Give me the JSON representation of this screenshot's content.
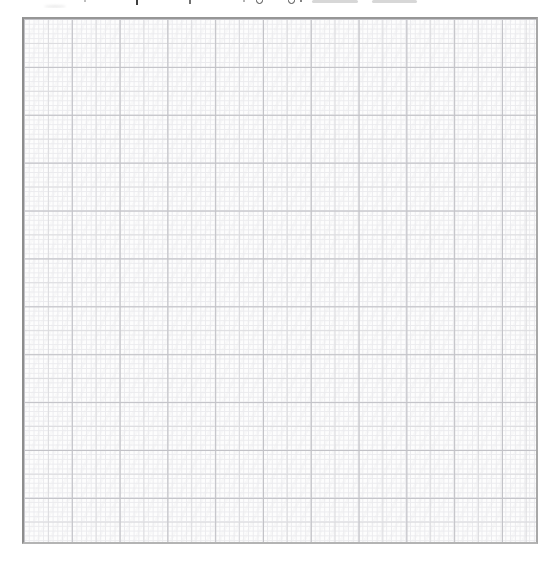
{
  "page": {
    "background_color": "#ffffff"
  },
  "clipped_caption": {
    "note": "Only descender fragments of a cropped, unreadable text line are visible at the top edge",
    "fragments": [
      {
        "kind": "smudge",
        "x": 44,
        "y": 5,
        "w": 22,
        "h": 3,
        "color": "#ececec"
      },
      {
        "kind": "dot",
        "x": 84,
        "y": 0,
        "w": 2,
        "h": 2,
        "color": "#a8a8a8"
      },
      {
        "kind": "stem",
        "x": 136,
        "y": 0,
        "w": 2,
        "h": 5,
        "color": "#3f3f3f"
      },
      {
        "kind": "stem",
        "x": 189,
        "y": 0,
        "w": 2,
        "h": 4,
        "color": "#707070"
      },
      {
        "kind": "dot",
        "x": 243,
        "y": 0,
        "w": 2,
        "h": 2,
        "color": "#9a9a9a"
      },
      {
        "kind": "loop",
        "x": 256,
        "y": -3,
        "w": 7,
        "h": 7,
        "color": "#4a4a4a"
      },
      {
        "kind": "loop",
        "x": 288,
        "y": -3,
        "w": 7,
        "h": 7,
        "color": "#4a4a4a"
      },
      {
        "kind": "dot",
        "x": 300,
        "y": 0,
        "w": 2,
        "h": 2,
        "color": "#5a5a5a"
      },
      {
        "kind": "bar",
        "x": 312,
        "y": 0,
        "w": 46,
        "h": 2.5,
        "color": "#d7d7d7"
      },
      {
        "kind": "bar",
        "x": 372,
        "y": 0,
        "w": 45,
        "h": 2.5,
        "color": "#d7d7d7"
      }
    ]
  },
  "graph_paper": {
    "paper_color": "#fdfdfd",
    "fine_line_color": "#ebebee",
    "medium_line_color": "#dcdcdf",
    "major_line_color": "#c2c2c7",
    "border_color": "#949494",
    "major_columns": 11,
    "major_rows": 11,
    "subdivisions_per_major": 10,
    "major_spacing_x": 47.8,
    "major_spacing_y": 47.9
  },
  "chart_data": {
    "type": "grid",
    "title": "",
    "xlabel": "",
    "ylabel": "",
    "categories": [],
    "series": [],
    "annotations": [],
    "note": "Empty graph-paper grid: 11x11 major squares, each subdivided into 10x10 fine squares. No data points, axis ticks, labels, or legend are visible."
  }
}
